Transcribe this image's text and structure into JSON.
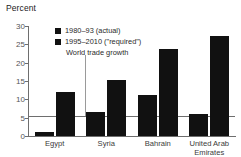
{
  "chart_data": {
    "type": "bar",
    "title": "",
    "ylabel": "Percent",
    "xlabel": "",
    "ylim": [
      0,
      30
    ],
    "yticks": [
      0,
      5,
      10,
      15,
      20,
      25,
      30
    ],
    "grid": false,
    "legend_position": "top-left inside plot",
    "categories": [
      "Egypt",
      "Syria",
      "Bahrain",
      "United Arab Emirates"
    ],
    "category_lines": [
      [
        "Egypt"
      ],
      [
        "Syria"
      ],
      [
        "Bahrain"
      ],
      [
        "United Arab",
        "Emirates"
      ]
    ],
    "series": [
      {
        "name": "1980–93 (actual)",
        "values": [
          1.2,
          6.5,
          11.2,
          6.0
        ],
        "color": "#111111"
      },
      {
        "name": "1995–2010 (\"required\")",
        "values": [
          12.0,
          15.2,
          23.6,
          27.3
        ],
        "color": "#111111"
      }
    ],
    "annotations": [
      {
        "name": "world-trade-growth",
        "label": "World trade growth",
        "value": 5.5,
        "type": "horizontal-reference-line"
      }
    ]
  },
  "legend": {
    "items": [
      {
        "label": "1980–93 (actual)"
      },
      {
        "label": "1995–2010 (\"required\")"
      }
    ]
  }
}
